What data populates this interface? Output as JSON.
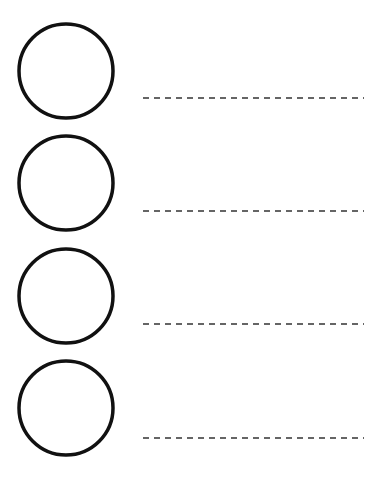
{
  "worksheet": {
    "background": "#ffffff",
    "circle_color": "#111111",
    "line_color": "#333333",
    "rows": [
      {
        "circle": {
          "cx": 66,
          "cy": 71,
          "r": 47
        },
        "line": {
          "x1": 143,
          "x2": 364,
          "y": 98
        }
      },
      {
        "circle": {
          "cx": 66,
          "cy": 183,
          "r": 47
        },
        "line": {
          "x1": 143,
          "x2": 364,
          "y": 211
        }
      },
      {
        "circle": {
          "cx": 66,
          "cy": 296,
          "r": 47
        },
        "line": {
          "x1": 143,
          "x2": 364,
          "y": 324
        }
      },
      {
        "circle": {
          "cx": 66,
          "cy": 408,
          "r": 47
        },
        "line": {
          "x1": 143,
          "x2": 364,
          "y": 438
        }
      }
    ]
  }
}
